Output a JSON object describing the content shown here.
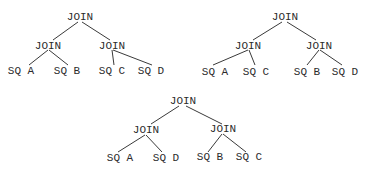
{
  "diagram": {
    "type": "join-trees",
    "trees": [
      {
        "root": "JOIN",
        "left": {
          "label": "JOIN",
          "children": [
            "SQ A",
            "SQ B"
          ]
        },
        "right": {
          "label": "JOIN",
          "children": [
            "SQ C",
            "SQ D"
          ]
        }
      },
      {
        "root": "JOIN",
        "left": {
          "label": "JOIN",
          "children": [
            "SQ A",
            "SQ C"
          ]
        },
        "right": {
          "label": "JOIN",
          "children": [
            "SQ B",
            "SQ D"
          ]
        }
      },
      {
        "root": "JOIN",
        "left": {
          "label": "JOIN",
          "children": [
            "SQ A",
            "SQ D"
          ]
        },
        "right": {
          "label": "JOIN",
          "children": [
            "SQ B",
            "SQ C"
          ]
        }
      }
    ]
  }
}
